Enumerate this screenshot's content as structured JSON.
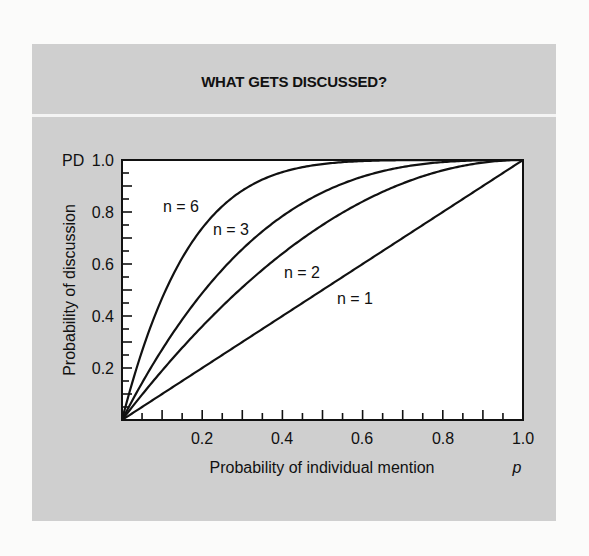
{
  "figure": {
    "title": "WHAT GETS DISCUSSED?",
    "y_axis_symbol": "PD",
    "x_axis_symbol": "p",
    "ylabel": "Probability of discussion",
    "xlabel": "Probability of individual mention",
    "x_ticks": [
      "0.2",
      "0.4",
      "0.6",
      "0.8",
      "1.0"
    ],
    "y_ticks": [
      "0.2",
      "0.4",
      "0.6",
      "0.8",
      "1.0"
    ],
    "curve_labels": [
      "n = 6",
      "n = 3",
      "n = 2",
      "n = 1"
    ],
    "colors": {
      "panel": "#cfcfcf",
      "plot_bg": "#ffffff",
      "line": "#111111",
      "divider": "#f4f4f4"
    }
  },
  "chart_data": {
    "type": "line",
    "title": "WHAT GETS DISCUSSED?",
    "xlabel": "Probability of individual mention (p)",
    "ylabel": "Probability of discussion (PD)",
    "xlim": [
      0,
      1
    ],
    "ylim": [
      0,
      1
    ],
    "x_ticks": [
      0.2,
      0.4,
      0.6,
      0.8,
      1.0
    ],
    "y_ticks": [
      0.2,
      0.4,
      0.6,
      0.8,
      1.0
    ],
    "minor_tick_step": 0.05,
    "grid": false,
    "legend": "inline labels on curves",
    "formula": "PD = 1 - (1 - p)^n",
    "x": [
      0,
      0.1,
      0.2,
      0.3,
      0.4,
      0.5,
      0.6,
      0.7,
      0.8,
      0.9,
      1.0
    ],
    "series": [
      {
        "name": "n = 6",
        "n": 6,
        "values": [
          0,
          0.469,
          0.738,
          0.882,
          0.953,
          0.984,
          0.996,
          0.999,
          1.0,
          1.0,
          1.0
        ]
      },
      {
        "name": "n = 3",
        "n": 3,
        "values": [
          0,
          0.271,
          0.488,
          0.657,
          0.784,
          0.875,
          0.936,
          0.973,
          0.992,
          0.999,
          1.0
        ]
      },
      {
        "name": "n = 2",
        "n": 2,
        "values": [
          0,
          0.19,
          0.36,
          0.51,
          0.64,
          0.75,
          0.84,
          0.91,
          0.96,
          0.99,
          1.0
        ]
      },
      {
        "name": "n = 1",
        "n": 1,
        "values": [
          0,
          0.1,
          0.2,
          0.3,
          0.4,
          0.5,
          0.6,
          0.7,
          0.8,
          0.9,
          1.0
        ]
      }
    ]
  }
}
